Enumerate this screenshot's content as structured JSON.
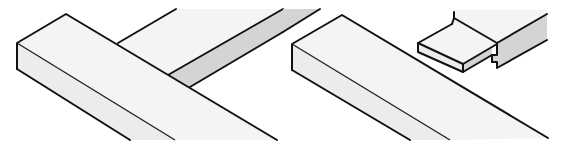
{
  "figure": {
    "title": "",
    "panels": [
      {
        "id": "left",
        "label": "",
        "joint": "butt T-joint"
      },
      {
        "id": "right",
        "label": "",
        "joint": "tongue / rebate joint"
      }
    ]
  },
  "colors": {
    "line": "#111111",
    "face_light": "#f4f4f4",
    "face_mid": "#ececec",
    "face_shaded": "#d4d4d4",
    "background": "#ffffff"
  }
}
